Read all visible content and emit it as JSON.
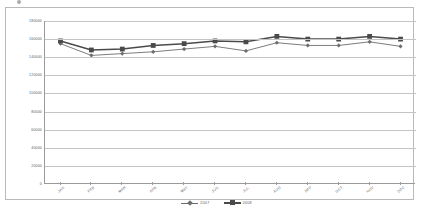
{
  "chart_data": {
    "type": "line",
    "title": "",
    "subtitle": "",
    "xlabel": "",
    "ylabel": "",
    "categories": [
      "JAN",
      "FEB",
      "MAR",
      "APR",
      "MAY",
      "JUN",
      "JUL",
      "AUG",
      "SEP",
      "OCT",
      "NOV",
      "DEC"
    ],
    "ylim": [
      0,
      180000
    ],
    "y_ticks": [
      0,
      20000,
      40000,
      60000,
      80000,
      100000,
      120000,
      140000,
      160000,
      180000
    ],
    "y_tick_labels": [
      "0",
      "20000",
      "40000",
      "60000",
      "80000",
      "100000",
      "120000",
      "140000",
      "160000",
      "180000"
    ],
    "grid": true,
    "grid_axis": "y",
    "legend_position": "bottom",
    "series": [
      {
        "name": "2007",
        "marker": "diamond",
        "color": "#6d6d6d",
        "values": [
          155000,
          142000,
          144000,
          146000,
          149000,
          152000,
          147000,
          156000,
          153000,
          153000,
          157000,
          152000
        ]
      },
      {
        "name": "2008",
        "marker": "square",
        "color": "#4a4a4a",
        "values": [
          158000,
          148000,
          149000,
          153000,
          155000,
          158000,
          157000,
          163000,
          160000,
          160000,
          163000,
          160000
        ]
      }
    ]
  },
  "legend": {
    "entries": [
      {
        "label": "2007",
        "marker": "diamond-marker"
      },
      {
        "label": "2008",
        "marker": "square-marker"
      }
    ]
  }
}
